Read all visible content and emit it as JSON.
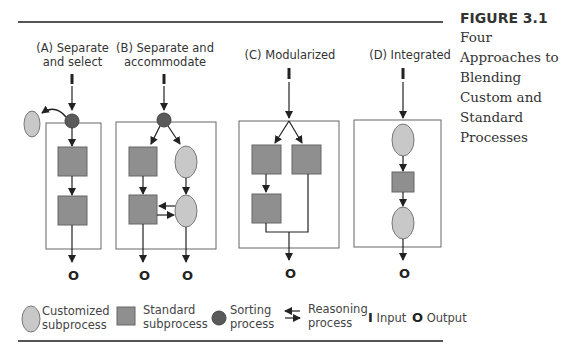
{
  "figure": {
    "number": "FIGURE 3.1",
    "title_lines": [
      "Four",
      "Approaches to",
      "Blending",
      "Custom and",
      "Standard",
      "Processes"
    ]
  },
  "panels": [
    {
      "id": "A",
      "title_lines": [
        "(A) Separate",
        "and select"
      ],
      "outputs": [
        "O"
      ]
    },
    {
      "id": "B",
      "title_lines": [
        "(B) Separate and",
        "accommodate"
      ],
      "outputs": [
        "O",
        "O"
      ]
    },
    {
      "id": "C",
      "title_lines": [
        "(C) Modularized"
      ],
      "outputs": [
        "O"
      ]
    },
    {
      "id": "D",
      "title_lines": [
        "(D) Integrated"
      ],
      "outputs": [
        "O"
      ]
    }
  ],
  "legend": {
    "customized": [
      "Customized",
      "subprocess"
    ],
    "standard": [
      "Standard",
      "subprocess"
    ],
    "sorting": [
      "Sorting",
      "process"
    ],
    "reasoning": [
      "Reasoning",
      "process"
    ],
    "input_symbol": "I",
    "input_label": "Input",
    "output_symbol": "O",
    "output_label": "Output"
  },
  "colors": {
    "customized_fill": "#c8c8c8",
    "standard_fill": "#8f8f8f",
    "sorting_fill": "#5a5a5a",
    "line": "#222222",
    "box_border": "#666666"
  }
}
